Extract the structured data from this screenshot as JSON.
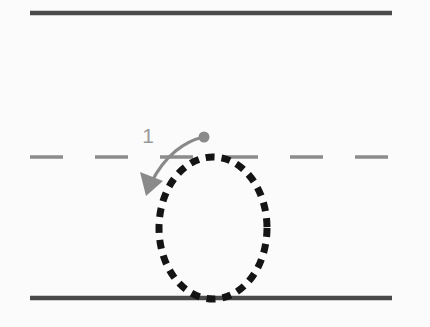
{
  "figure": {
    "background_color": "#fbfbfb",
    "width": 430,
    "height": 327
  },
  "road": {
    "boundary_color": "#4a4a4a",
    "center_line_color": "#8c8c8c",
    "top_boundary": {
      "name": "top road boundary",
      "x1": 30,
      "y1": 13,
      "x2": 392,
      "y2": 13,
      "stroke_width": 4.5,
      "style": "solid"
    },
    "bottom_boundary": {
      "name": "bottom road boundary",
      "x1": 30,
      "y1": 298,
      "x2": 392,
      "y2": 298,
      "stroke_width": 4.5,
      "style": "solid"
    },
    "center_divider": {
      "name": "center lane divider",
      "x1": 30,
      "y1": 157,
      "x2": 392,
      "y2": 157,
      "stroke_width": 3.5,
      "style": "dashed",
      "dash_length": 33,
      "gap_length": 32
    }
  },
  "trajectory": {
    "name": "dotted circular trajectory",
    "shape": "ellipse",
    "center_x": 213,
    "center_y": 228,
    "radius_x": 54,
    "radius_y": 71,
    "stroke_color": "#141414",
    "stroke_width": 7,
    "dash_length": 9,
    "gap_length": 7
  },
  "annotation": {
    "name": "maneuver-1 arrow",
    "label": "1",
    "label_x": 148,
    "label_y": 143,
    "label_color": "#9a9a9a",
    "label_font_size": 21,
    "arrow_color": "#8a8a8a",
    "arrow_stroke_width": 3.2,
    "start_dot": {
      "x": 204,
      "y": 137,
      "radius": 5.5
    },
    "curve_path": "M 204 137 C 185 141 165 155 151 183",
    "arrow_head": {
      "tip_x": 146,
      "tip_y": 196,
      "direction": "down-left"
    }
  }
}
